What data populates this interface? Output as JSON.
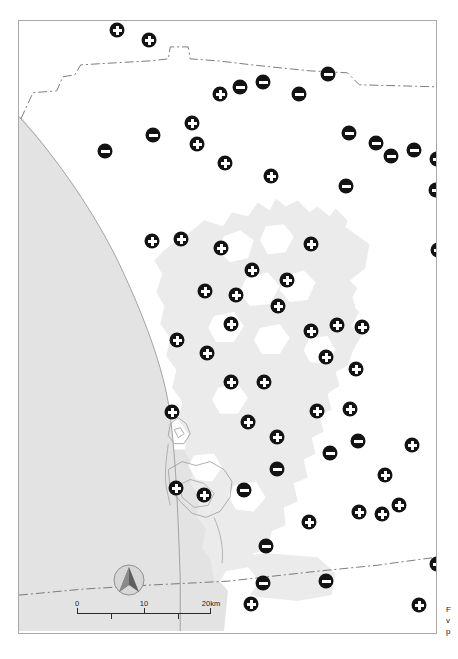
{
  "map": {
    "title": "Distribution map of survey sites",
    "frame": {
      "x": 18,
      "y": 20,
      "width": 419,
      "height": 614,
      "border_color": "#a8a8a8"
    },
    "colors": {
      "ocean": "#e3e3e3",
      "urban": "#ebebeb",
      "land": "#ffffff",
      "marker_fill": "#131313",
      "marker_symbol": "#ffffff",
      "boundary_line": "#6e6e6e",
      "coastline": "#9a9a9a",
      "frame_border": "#a8a8a8"
    },
    "scale_bar": {
      "labels": [
        "0",
        "10",
        "20km"
      ],
      "label_positions_pct": [
        0,
        50,
        100
      ],
      "major_ticks_pct": [
        0,
        50,
        100
      ],
      "minor_ticks_pct": [
        25,
        75
      ],
      "units": "km",
      "max_value": 20
    },
    "north_arrow": {
      "label": "north-arrow",
      "direction": "N"
    },
    "edge_caption": {
      "lines": [
        "F",
        "v",
        "p"
      ]
    },
    "legend": {
      "plus_marker": "positive site",
      "minus_marker": "negative site"
    },
    "markers": [
      {
        "x": 116,
        "y": 29,
        "type": "plus"
      },
      {
        "x": 148,
        "y": 39,
        "type": "plus"
      },
      {
        "x": 219,
        "y": 93,
        "type": "plus"
      },
      {
        "x": 239,
        "y": 86,
        "type": "minus"
      },
      {
        "x": 262,
        "y": 81,
        "type": "minus"
      },
      {
        "x": 298,
        "y": 93,
        "type": "minus"
      },
      {
        "x": 327,
        "y": 73,
        "type": "minus"
      },
      {
        "x": 104,
        "y": 150,
        "type": "minus"
      },
      {
        "x": 152,
        "y": 134,
        "type": "minus"
      },
      {
        "x": 191,
        "y": 122,
        "type": "plus"
      },
      {
        "x": 196,
        "y": 143,
        "type": "plus"
      },
      {
        "x": 224,
        "y": 162,
        "type": "plus"
      },
      {
        "x": 270,
        "y": 175,
        "type": "plus"
      },
      {
        "x": 348,
        "y": 132,
        "type": "minus"
      },
      {
        "x": 375,
        "y": 142,
        "type": "minus"
      },
      {
        "x": 345,
        "y": 185,
        "type": "minus"
      },
      {
        "x": 390,
        "y": 155,
        "type": "minus"
      },
      {
        "x": 413,
        "y": 149,
        "type": "minus"
      },
      {
        "x": 436,
        "y": 158,
        "type": "minus"
      },
      {
        "x": 435,
        "y": 189,
        "type": "minus"
      },
      {
        "x": 151,
        "y": 240,
        "type": "plus"
      },
      {
        "x": 180,
        "y": 238,
        "type": "plus"
      },
      {
        "x": 220,
        "y": 247,
        "type": "plus"
      },
      {
        "x": 310,
        "y": 243,
        "type": "plus"
      },
      {
        "x": 437,
        "y": 249,
        "type": "minus"
      },
      {
        "x": 251,
        "y": 269,
        "type": "plus"
      },
      {
        "x": 286,
        "y": 279,
        "type": "plus"
      },
      {
        "x": 235,
        "y": 294,
        "type": "plus"
      },
      {
        "x": 204,
        "y": 290,
        "type": "plus"
      },
      {
        "x": 277,
        "y": 305,
        "type": "plus"
      },
      {
        "x": 310,
        "y": 330,
        "type": "plus"
      },
      {
        "x": 336,
        "y": 324,
        "type": "plus"
      },
      {
        "x": 361,
        "y": 326,
        "type": "plus"
      },
      {
        "x": 230,
        "y": 323,
        "type": "plus"
      },
      {
        "x": 206,
        "y": 352,
        "type": "plus"
      },
      {
        "x": 176,
        "y": 339,
        "type": "plus"
      },
      {
        "x": 325,
        "y": 356,
        "type": "plus"
      },
      {
        "x": 355,
        "y": 368,
        "type": "plus"
      },
      {
        "x": 263,
        "y": 381,
        "type": "plus"
      },
      {
        "x": 230,
        "y": 381,
        "type": "plus"
      },
      {
        "x": 171,
        "y": 411,
        "type": "plus"
      },
      {
        "x": 247,
        "y": 421,
        "type": "plus"
      },
      {
        "x": 276,
        "y": 436,
        "type": "plus"
      },
      {
        "x": 316,
        "y": 410,
        "type": "plus"
      },
      {
        "x": 349,
        "y": 408,
        "type": "plus"
      },
      {
        "x": 329,
        "y": 452,
        "type": "minus"
      },
      {
        "x": 357,
        "y": 440,
        "type": "minus"
      },
      {
        "x": 384,
        "y": 474,
        "type": "plus"
      },
      {
        "x": 411,
        "y": 444,
        "type": "plus"
      },
      {
        "x": 276,
        "y": 468,
        "type": "minus"
      },
      {
        "x": 243,
        "y": 489,
        "type": "minus"
      },
      {
        "x": 175,
        "y": 487,
        "type": "plus"
      },
      {
        "x": 203,
        "y": 494,
        "type": "plus"
      },
      {
        "x": 358,
        "y": 511,
        "type": "plus"
      },
      {
        "x": 381,
        "y": 513,
        "type": "plus"
      },
      {
        "x": 398,
        "y": 504,
        "type": "plus"
      },
      {
        "x": 308,
        "y": 521,
        "type": "plus"
      },
      {
        "x": 265,
        "y": 545,
        "type": "minus"
      },
      {
        "x": 262,
        "y": 582,
        "type": "minus"
      },
      {
        "x": 325,
        "y": 580,
        "type": "minus"
      },
      {
        "x": 436,
        "y": 563,
        "type": "minus"
      },
      {
        "x": 418,
        "y": 604,
        "type": "plus"
      },
      {
        "x": 250,
        "y": 603,
        "type": "plus"
      }
    ]
  }
}
